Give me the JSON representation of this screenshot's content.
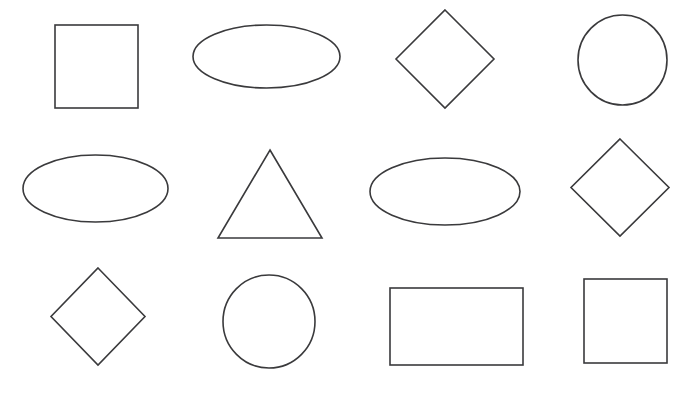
{
  "canvas": {
    "width": 698,
    "height": 393,
    "background_color": "#ffffff",
    "stroke_color": "#3a3a3c",
    "fill_color": "none",
    "stroke_width": 1.6,
    "title": "Geometric Shapes"
  },
  "grid": {
    "rows": 3,
    "columns": 4,
    "total_shapes": 12
  },
  "shapes": [
    {
      "id": "shape-1",
      "name": "square",
      "row": 1,
      "column": 1,
      "x": 55,
      "y": 25,
      "width": 83,
      "height": 83,
      "center_x": 96.5,
      "center_y": 66.5
    },
    {
      "id": "shape-2",
      "name": "ellipse",
      "row": 1,
      "column": 2,
      "x": 193,
      "y": 25,
      "width": 147,
      "height": 63,
      "center_x": 266.5,
      "center_y": 56.5
    },
    {
      "id": "shape-3",
      "name": "diamond",
      "row": 1,
      "column": 3,
      "x": 396,
      "y": 10,
      "width": 98,
      "height": 98,
      "center_x": 445,
      "center_y": 59
    },
    {
      "id": "shape-4",
      "name": "circle",
      "row": 1,
      "column": 4,
      "x": 578,
      "y": 15,
      "width": 89,
      "height": 90,
      "center_x": 622.5,
      "center_y": 60
    },
    {
      "id": "shape-5",
      "name": "ellipse",
      "row": 2,
      "column": 1,
      "x": 23,
      "y": 155,
      "width": 145,
      "height": 67,
      "center_x": 95.5,
      "center_y": 188.5
    },
    {
      "id": "shape-6",
      "name": "triangle",
      "row": 2,
      "column": 2,
      "x": 218,
      "y": 150,
      "width": 104,
      "height": 88,
      "center_x": 270,
      "center_y": 194
    },
    {
      "id": "shape-7",
      "name": "ellipse",
      "row": 2,
      "column": 3,
      "x": 370,
      "y": 158,
      "width": 150,
      "height": 67,
      "center_x": 445,
      "center_y": 191.5
    },
    {
      "id": "shape-8",
      "name": "diamond",
      "row": 2,
      "column": 4,
      "x": 571,
      "y": 139,
      "width": 98,
      "height": 97,
      "center_x": 620,
      "center_y": 187.5
    },
    {
      "id": "shape-9",
      "name": "diamond",
      "row": 3,
      "column": 1,
      "x": 51,
      "y": 268,
      "width": 94,
      "height": 97,
      "center_x": 98,
      "center_y": 316.5
    },
    {
      "id": "shape-10",
      "name": "circle",
      "row": 3,
      "column": 2,
      "x": 223,
      "y": 275,
      "width": 92,
      "height": 93,
      "center_x": 269,
      "center_y": 321.5
    },
    {
      "id": "shape-11",
      "name": "rectangle",
      "row": 3,
      "column": 3,
      "x": 390,
      "y": 288,
      "width": 133,
      "height": 77,
      "center_x": 456.5,
      "center_y": 326.5
    },
    {
      "id": "shape-12",
      "name": "square",
      "row": 3,
      "column": 4,
      "x": 584,
      "y": 279,
      "width": 83,
      "height": 84,
      "center_x": 625.5,
      "center_y": 321
    }
  ]
}
